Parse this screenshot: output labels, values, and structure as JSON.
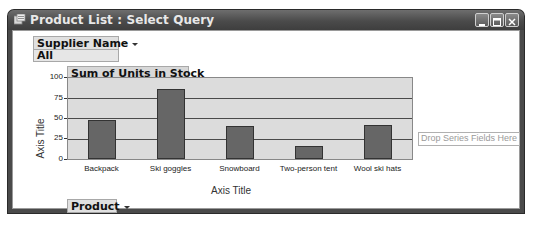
{
  "window": {
    "title": "Product List : Select Query",
    "buttons": [
      "minimize",
      "maximize",
      "close"
    ]
  },
  "filter": {
    "field_label": "Supplier Name",
    "value": "All"
  },
  "chart": {
    "data_field_label": "Sum of Units in Stock",
    "y_axis_title": "Axis Title",
    "x_axis_title": "Axis Title",
    "category_field_label": "Product",
    "series_drop_zone": "Drop Series Fields Here"
  },
  "chart_data": {
    "type": "bar",
    "title": "Sum of Units in Stock",
    "categories": [
      "Backpack",
      "Ski goggles",
      "Snowboard",
      "Two-person tent",
      "Wool ski hats"
    ],
    "values": [
      48,
      86,
      41,
      16,
      42
    ],
    "xlabel": "Axis Title",
    "ylabel": "Axis Title",
    "ylim": [
      0,
      100
    ],
    "yticks": [
      "0",
      "25",
      "50",
      "75",
      "100"
    ],
    "grid": true,
    "legend": "none"
  }
}
